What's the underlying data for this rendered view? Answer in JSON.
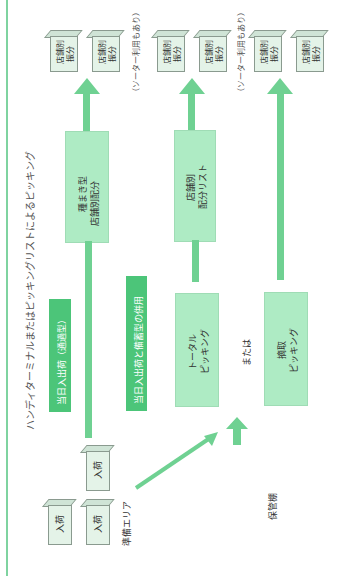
{
  "title": "ハンディターミナルまたはピッキングリストによるピッキング",
  "destinations": {
    "store_sort_label_1": "店舗別",
    "store_sort_label_2": "振分",
    "sorter_note": "（ソーター利用もあり）"
  },
  "flows": {
    "through_type": "当日入出荷（通過型）",
    "combined_type": "当日入出荷と備蓄型の併用"
  },
  "process_boxes": {
    "seed_distribution_line1": "種まき型",
    "seed_distribution_line2": "店舗別配分",
    "store_list_line1": "店舗別",
    "store_list_line2": "配分リスト",
    "total_picking_line1": "トータル",
    "total_picking_line2": "ピッキング",
    "pick_picking_line1": "摘取",
    "pick_picking_line2": "ピッキング",
    "or_label": "または"
  },
  "areas": {
    "staging": "準備エリア",
    "storage": "保管棚",
    "inbound": "入荷"
  },
  "colors": {
    "arrow": "#6fd192",
    "light_box": "#aeebc4",
    "dark_box": "#4cc579",
    "frame_line": "#7fd3a0"
  }
}
